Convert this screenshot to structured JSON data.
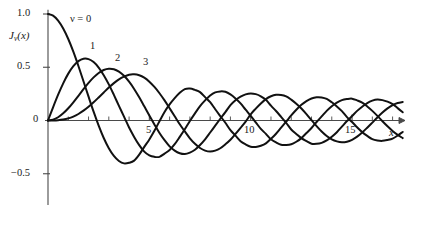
{
  "figure": {
    "background_color": "#ffffff",
    "line_color": "#111111",
    "axis_color": "#4a4a4a"
  },
  "axes": {
    "y_axis_label": "J",
    "y_axis_label_sub": "ν",
    "y_axis_label_arg": "(x)",
    "x_axis_label": "x",
    "x_ticks_labeled": [
      {
        "value": 5,
        "label": "5"
      },
      {
        "value": 10,
        "label": "10"
      },
      {
        "value": 15,
        "label": "15"
      }
    ],
    "y_ticks_labeled": [
      {
        "value": 1.0,
        "label": "1.0"
      },
      {
        "value": 0.5,
        "label": "0.5"
      },
      {
        "value": 0.0,
        "label": "0"
      },
      {
        "value": -0.5,
        "label": "−0.5"
      }
    ]
  },
  "curve_labels": [
    {
      "text": "ν = 0",
      "x_px": 70,
      "y_px": 13,
      "italic_nu": true
    },
    {
      "text": "1",
      "x_px": 90,
      "y_px": 40,
      "italic_nu": false
    },
    {
      "text": "2",
      "x_px": 115,
      "y_px": 52,
      "italic_nu": false
    },
    {
      "text": "3",
      "x_px": 143,
      "y_px": 56,
      "italic_nu": false
    }
  ],
  "chart_data": {
    "type": "line",
    "title": "",
    "xlabel": "x",
    "ylabel": "J_nu(x)",
    "xlim": [
      0,
      17.6
    ],
    "ylim": [
      -0.72,
      1.08
    ],
    "grid": false,
    "legend": "inline curve labels",
    "x_tick_interval": 1,
    "x_major_labels": [
      5,
      10,
      15
    ],
    "y_ticks": [
      1.0,
      0.5,
      0.0,
      -0.5
    ],
    "series": [
      {
        "name": "nu = 0",
        "order": 0,
        "x": [
          0,
          0.25,
          0.5,
          0.75,
          1,
          1.25,
          1.5,
          1.75,
          2,
          2.25,
          2.5,
          2.75,
          3,
          3.25,
          3.5,
          3.75,
          4,
          4.25,
          4.5,
          4.75,
          5,
          5.25,
          5.5,
          5.75,
          6,
          6.25,
          6.5,
          6.75,
          7,
          7.25,
          7.5,
          7.75,
          8,
          8.25,
          8.5,
          8.75,
          9,
          9.25,
          9.5,
          9.75,
          10,
          10.25,
          10.5,
          10.75,
          11,
          11.25,
          11.5,
          11.75,
          12,
          12.25,
          12.5,
          12.75,
          13,
          13.25,
          13.5,
          13.75,
          14,
          14.25,
          14.5,
          14.75,
          15,
          15.25,
          15.5,
          15.75,
          16,
          16.25,
          16.5,
          16.75,
          17,
          17.25,
          17.5
        ],
        "y": [
          1.0,
          0.9844,
          0.9385,
          0.8642,
          0.7652,
          0.6459,
          0.5118,
          0.369,
          0.2239,
          0.0827,
          -0.0484,
          -0.1641,
          -0.2601,
          -0.3325,
          -0.3801,
          -0.4026,
          -0.3971,
          -0.3766,
          -0.3205,
          -0.2477,
          -0.1776,
          -0.0968,
          -0.0068,
          0.0802,
          0.1506,
          0.2095,
          0.2601,
          0.294,
          0.3001,
          0.287,
          0.2663,
          0.2193,
          0.1717,
          0.1056,
          0.0419,
          -0.0211,
          -0.0903,
          -0.142,
          -0.1939,
          -0.2244,
          -0.2459,
          -0.2478,
          -0.2366,
          -0.2144,
          -0.1712,
          -0.1244,
          -0.0677,
          -0.0104,
          0.0477,
          0.1005,
          0.1469,
          0.1827,
          0.2069,
          0.2184,
          0.2167,
          0.2023,
          0.1711,
          0.1322,
          0.0875,
          0.0323,
          -0.0142,
          -0.0641,
          -0.1092,
          -0.1447,
          -0.1749,
          -0.1876,
          -0.1912,
          -0.183,
          -0.1699,
          -0.1421,
          -0.1076
        ]
      },
      {
        "name": "nu = 1",
        "order": 1,
        "x": [
          0,
          0.25,
          0.5,
          0.75,
          1,
          1.25,
          1.5,
          1.75,
          2,
          2.25,
          2.5,
          2.75,
          3,
          3.25,
          3.5,
          3.75,
          4,
          4.25,
          4.5,
          4.75,
          5,
          5.25,
          5.5,
          5.75,
          6,
          6.25,
          6.5,
          6.75,
          7,
          7.25,
          7.5,
          7.75,
          8,
          8.25,
          8.5,
          8.75,
          9,
          9.25,
          9.5,
          9.75,
          10,
          10.25,
          10.5,
          10.75,
          11,
          11.25,
          11.5,
          11.75,
          12,
          12.25,
          12.5,
          12.75,
          13,
          13.25,
          13.5,
          13.75,
          14,
          14.25,
          14.5,
          14.75,
          15,
          15.25,
          15.5,
          15.75,
          16,
          16.25,
          16.5,
          16.75,
          17,
          17.25,
          17.5
        ],
        "y": [
          0.0,
          0.124,
          0.2423,
          0.3492,
          0.4401,
          0.5106,
          0.5579,
          0.5802,
          0.5767,
          0.5484,
          0.4971,
          0.4256,
          0.3391,
          0.2403,
          0.1374,
          0.0366,
          -0.066,
          -0.1538,
          -0.2311,
          -0.2919,
          -0.3276,
          -0.3414,
          -0.3414,
          -0.311,
          -0.2767,
          -0.2224,
          -0.1538,
          -0.0826,
          -0.0047,
          0.067,
          0.1352,
          0.1885,
          0.2346,
          0.2638,
          0.2731,
          0.2697,
          0.2453,
          0.2076,
          0.1613,
          0.1018,
          0.0435,
          -0.0172,
          -0.0789,
          -0.1255,
          -0.1768,
          -0.2061,
          -0.2284,
          -0.23,
          -0.2234,
          -0.1995,
          -0.1655,
          -0.118,
          -0.0703,
          -0.0138,
          0.038,
          0.0902,
          0.1334,
          0.1673,
          0.1914,
          0.2015,
          0.2051,
          0.1885,
          0.1672,
          0.1318,
          0.0904,
          0.0436,
          -0.0066,
          -0.0537,
          -0.0977,
          -0.1351,
          -0.1652
        ]
      },
      {
        "name": "nu = 2",
        "order": 2,
        "x": [
          0,
          0.25,
          0.5,
          0.75,
          1,
          1.25,
          1.5,
          1.75,
          2,
          2.25,
          2.5,
          2.75,
          3,
          3.25,
          3.5,
          3.75,
          4,
          4.25,
          4.5,
          4.75,
          5,
          5.25,
          5.5,
          5.75,
          6,
          6.25,
          6.5,
          6.75,
          7,
          7.25,
          7.5,
          7.75,
          8,
          8.25,
          8.5,
          8.75,
          9,
          9.25,
          9.5,
          9.75,
          10,
          10.25,
          10.5,
          10.75,
          11,
          11.25,
          11.5,
          11.75,
          12,
          12.25,
          12.5,
          12.75,
          13,
          13.25,
          13.5,
          13.75,
          14,
          14.25,
          14.5,
          14.75,
          15,
          15.25,
          15.5,
          15.75,
          16,
          16.25,
          16.5,
          16.75,
          17,
          17.25,
          17.5
        ],
        "y": [
          0.0,
          0.0078,
          0.0306,
          0.0673,
          0.1149,
          0.1711,
          0.2321,
          0.294,
          0.3528,
          0.4046,
          0.4461,
          0.4746,
          0.4861,
          0.4813,
          0.4586,
          0.4194,
          0.3641,
          0.2963,
          0.2178,
          0.1331,
          0.0466,
          -0.0373,
          -0.1173,
          -0.185,
          -0.2429,
          -0.2826,
          -0.3074,
          -0.3151,
          -0.3014,
          -0.2749,
          -0.2303,
          -0.1769,
          -0.113,
          -0.0477,
          0.0163,
          0.0788,
          0.1448,
          0.1903,
          0.2235,
          0.2456,
          0.2546,
          0.2474,
          0.2276,
          0.1942,
          0.1395,
          0.0889,
          0.0339,
          -0.0222,
          -0.0849,
          -0.1264,
          -0.1655,
          -0.1935,
          -0.2177,
          -0.219,
          -0.2097,
          -0.1868,
          -0.152,
          -0.1097,
          -0.0577,
          -0.0053,
          0.0416,
          0.0905,
          0.1297,
          0.1637,
          0.1862,
          0.1971,
          0.1912,
          0.1766,
          0.1537,
          0.1163,
          0.0775
        ]
      },
      {
        "name": "nu = 3",
        "order": 3,
        "x": [
          0,
          0.25,
          0.5,
          0.75,
          1,
          1.25,
          1.5,
          1.75,
          2,
          2.25,
          2.5,
          2.75,
          3,
          3.25,
          3.5,
          3.75,
          4,
          4.25,
          4.5,
          4.75,
          5,
          5.25,
          5.5,
          5.75,
          6,
          6.25,
          6.5,
          6.75,
          7,
          7.25,
          7.5,
          7.75,
          8,
          8.25,
          8.5,
          8.75,
          9,
          9.25,
          9.5,
          9.75,
          10,
          10.25,
          10.5,
          10.75,
          11,
          11.25,
          11.5,
          11.75,
          12,
          12.25,
          12.5,
          12.75,
          13,
          13.25,
          13.5,
          13.75,
          14,
          14.25,
          14.5,
          14.75,
          15,
          15.25,
          15.5,
          15.75,
          16,
          16.25,
          16.5,
          16.75,
          17,
          17.25,
          17.5
        ],
        "y": [
          0.0,
          0.0003,
          0.0026,
          0.0086,
          0.0196,
          0.0369,
          0.061,
          0.0922,
          0.1289,
          0.1707,
          0.2166,
          0.2633,
          0.3091,
          0.3508,
          0.3868,
          0.4125,
          0.4302,
          0.4333,
          0.4245,
          0.4017,
          0.3648,
          0.3151,
          0.2561,
          0.1887,
          0.1148,
          0.0403,
          -0.0353,
          -0.1028,
          -0.1676,
          -0.219,
          -0.2581,
          -0.2826,
          -0.2911,
          -0.283,
          -0.2604,
          -0.2239,
          -0.1809,
          -0.1262,
          -0.069,
          -0.0098,
          0.0583,
          0.1116,
          0.16,
          0.2009,
          0.2273,
          0.2414,
          0.2405,
          0.2265,
          0.1956,
          0.1576,
          0.1125,
          0.0599,
          0.003,
          -0.0521,
          -0.1025,
          -0.145,
          -0.1768,
          -0.1963,
          -0.2047,
          -0.1993,
          -0.1812,
          -0.1518,
          -0.1128,
          -0.0675,
          -0.0196,
          0.0288,
          0.074,
          0.1133,
          0.1439,
          0.1643,
          0.1732
        ]
      }
    ]
  }
}
